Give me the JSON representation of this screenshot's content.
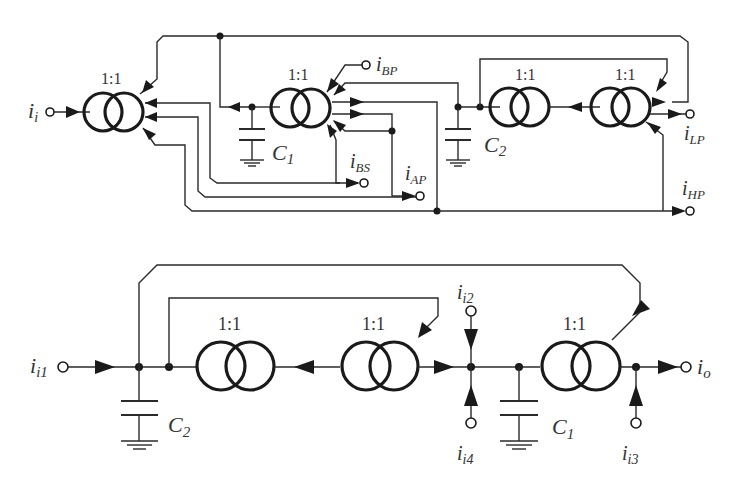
{
  "figure": {
    "top_circuit": {
      "name": "multi-output current-mode biquad filter",
      "ratio_labels": [
        "1:1",
        "1:1",
        "1:1",
        "1:1"
      ],
      "input": {
        "main": "i",
        "sub": "i"
      },
      "outputs": [
        {
          "main": "i",
          "sub": "BP"
        },
        {
          "main": "i",
          "sub": "BS"
        },
        {
          "main": "i",
          "sub": "AP"
        },
        {
          "main": "i",
          "sub": "LP"
        },
        {
          "main": "i",
          "sub": "HP"
        }
      ],
      "capacitors": [
        {
          "main": "C",
          "sub": "1"
        },
        {
          "main": "C",
          "sub": "2"
        }
      ]
    },
    "bottom_circuit": {
      "name": "multi-input current-mode biquad filter",
      "ratio_labels": [
        "1:1",
        "1:1",
        "1:1"
      ],
      "inputs": [
        {
          "main": "i",
          "sub": "i1"
        },
        {
          "main": "i",
          "sub": "i2"
        },
        {
          "main": "i",
          "sub": "i3"
        },
        {
          "main": "i",
          "sub": "i4"
        }
      ],
      "output": {
        "main": "i",
        "sub": "o"
      },
      "capacitors": [
        {
          "main": "C",
          "sub": "2"
        },
        {
          "main": "C",
          "sub": "1"
        }
      ]
    }
  }
}
